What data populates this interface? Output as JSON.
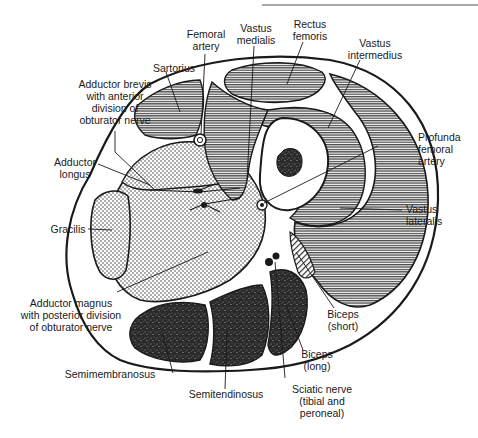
{
  "figure": {
    "colors": {
      "ink": "#1a1a1a",
      "paper": "#ffffff",
      "anterior_muscle_fill": "#8a8a8a",
      "adductor_fill": "#e8e8e8",
      "posterior_muscle_fill": "#3a3a3a"
    }
  },
  "labels": {
    "femoral_artery": {
      "line1": "Femoral",
      "line2": "artery"
    },
    "vastus_medialis": {
      "line1": "Vastus",
      "line2": "medialis"
    },
    "rectus_femoris": {
      "line1": "Rectus",
      "line2": "femoris"
    },
    "vastus_intermedius": {
      "line1": "Vastus",
      "line2": "intermedius"
    },
    "sartorius": {
      "line1": "Sartorius"
    },
    "adductor_brevis": {
      "line1": "Adductor brevis",
      "line2": "with anterior",
      "line3": "division of",
      "line4": "obturator nerve"
    },
    "profunda_femoral_artery": {
      "line1": "Profunda",
      "line2": "femoral",
      "line3": "artery"
    },
    "adductor_longus": {
      "line1": "Adductor",
      "line2": "longus"
    },
    "vastus_lateralis": {
      "line1": "Vastus",
      "line2": "lateralis"
    },
    "gracilis": {
      "line1": "Gracilis"
    },
    "adductor_magnus": {
      "line1": "Adductor magnus",
      "line2": "with posterior division",
      "line3": "of obturator nerve"
    },
    "biceps_short": {
      "line1": "Biceps",
      "line2": "(short)"
    },
    "biceps_long": {
      "line1": "Biceps",
      "line2": "(long)"
    },
    "semimembranosus": {
      "line1": "Semimembranosus"
    },
    "semitendinosus": {
      "line1": "Semitendinosus"
    },
    "sciatic_nerve": {
      "line1": "Sciatic nerve",
      "line2": "(tibial and",
      "line3": "peroneal)"
    }
  }
}
